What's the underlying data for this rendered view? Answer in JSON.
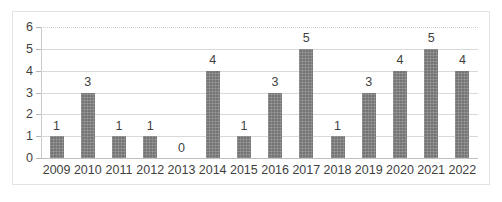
{
  "chart_data": {
    "type": "bar",
    "title": "",
    "subtitle": "",
    "xlabel": "",
    "ylabel": "",
    "categories": [
      "2009",
      "2010",
      "2011",
      "2012",
      "2013",
      "2014",
      "2015",
      "2016",
      "2017",
      "2018",
      "2019",
      "2020",
      "2021",
      "2022"
    ],
    "values": [
      1,
      3,
      1,
      1,
      0,
      4,
      1,
      3,
      5,
      1,
      3,
      4,
      5,
      4
    ],
    "data_labels": [
      "1",
      "3",
      "1",
      "1",
      "0",
      "4",
      "1",
      "3",
      "5",
      "1",
      "3",
      "4",
      "5",
      "4"
    ],
    "ylim": [
      0,
      6
    ],
    "ytick_values": [
      0,
      1,
      2,
      3,
      4,
      5,
      6
    ],
    "ytick_labels": [
      "0",
      "1",
      "2",
      "3",
      "4",
      "5",
      "6"
    ],
    "grid": true,
    "grid_axis": "y",
    "legend": false,
    "legend_position": "none",
    "series": [
      {
        "name": "",
        "values": [
          1,
          3,
          1,
          1,
          0,
          4,
          1,
          3,
          5,
          1,
          3,
          4,
          5,
          4
        ],
        "color": "#757575"
      }
    ]
  },
  "colors": {
    "bar_fill": "#757575",
    "gridline": "#d9d9d9",
    "axis_line": "#c9c9c9",
    "frame_border": "#e3e3e3",
    "text": "#3f3f3f",
    "background": "#ffffff"
  }
}
